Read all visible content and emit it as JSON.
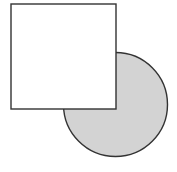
{
  "figure": {
    "canvas": {
      "width": 177,
      "height": 172,
      "background_color": "#FFFFFF"
    },
    "shapes": [
      {
        "name": "circle",
        "kind": "circle",
        "center_x": 115.5,
        "center_y": 104.5,
        "radius": 52,
        "bounds": {
          "left": 63.5,
          "top": 52.5,
          "right": 167.5,
          "bottom": 156.5
        },
        "fill_color": "#D3D3D3",
        "stroke_color": "#333333",
        "stroke_width": 1.4,
        "z_order": 1
      },
      {
        "name": "square",
        "kind": "rectangle",
        "x": 11,
        "y": 4,
        "width": 105,
        "height": 105,
        "bounds": {
          "left": 11,
          "top": 4,
          "right": 116,
          "bottom": 109
        },
        "fill_color": "#FFFFFF",
        "stroke_color": "#333333",
        "stroke_width": 1.4,
        "z_order": 2
      }
    ]
  }
}
